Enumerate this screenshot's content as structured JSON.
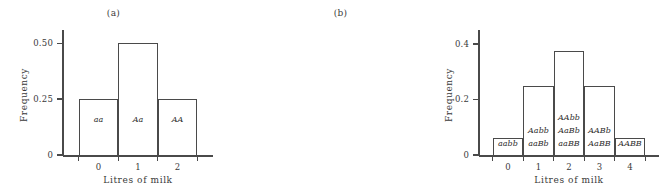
{
  "figure": {
    "caption_a": "(a)",
    "caption_b": "(b)"
  },
  "chart_data": [
    {
      "type": "bar",
      "title": "(a)",
      "xlabel": "Litres of milk",
      "ylabel": "Frequency",
      "categories": [
        "0",
        "1",
        "2"
      ],
      "values": [
        0.25,
        0.5,
        0.25
      ],
      "bar_labels": [
        [
          "aa"
        ],
        [
          "Aa"
        ],
        [
          "AA"
        ]
      ],
      "ytick_labels": [
        "0",
        "0.25",
        "0.50"
      ],
      "ytick_values": [
        0,
        0.25,
        0.5
      ],
      "xtick_labels": [
        "0",
        "1",
        "2"
      ],
      "ylim": [
        0,
        0.56
      ],
      "xlim": [
        -0.9,
        2.9
      ],
      "grid": false,
      "legend": "none",
      "axis_color": "#4a4a4a",
      "bar_fill": "none"
    },
    {
      "type": "bar",
      "title": "(b)",
      "xlabel": "Litres of milk",
      "ylabel": "Frequency",
      "categories": [
        "0",
        "1",
        "2",
        "3",
        "4"
      ],
      "values": [
        0.0625,
        0.25,
        0.375,
        0.25,
        0.0625
      ],
      "bar_labels": [
        [
          "aabb"
        ],
        [
          "Aabb",
          "aaBb"
        ],
        [
          "AAbb",
          "AaBb",
          "aaBB"
        ],
        [
          "AABb",
          "AaBB"
        ],
        [
          "AABB"
        ]
      ],
      "ytick_labels": [
        "0",
        "0.2",
        "0.4"
      ],
      "ytick_values": [
        0,
        0.2,
        0.4
      ],
      "xtick_labels": [
        "0",
        "1",
        "2",
        "3",
        "4"
      ],
      "ylim": [
        0,
        0.45
      ],
      "xlim": [
        -0.95,
        4.95
      ],
      "grid": false,
      "legend": "none",
      "axis_color": "#4a4a4a",
      "bar_fill": "none"
    }
  ]
}
